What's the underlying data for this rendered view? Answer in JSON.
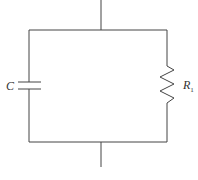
{
  "diagram": {
    "type": "circuit",
    "components": [
      {
        "id": "capacitor",
        "label": "C",
        "position": "left branch"
      },
      {
        "id": "resistor",
        "label": "R",
        "subscript": "1",
        "position": "right branch"
      }
    ],
    "colors": {
      "wire": "#444444",
      "background": "#ffffff"
    }
  }
}
